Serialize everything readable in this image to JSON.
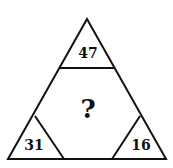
{
  "puzzle": {
    "top": "47",
    "bottom_left": "31",
    "bottom_right": "16",
    "center": "?"
  },
  "colors": {
    "line": "#111111",
    "background": "#ffffff"
  }
}
